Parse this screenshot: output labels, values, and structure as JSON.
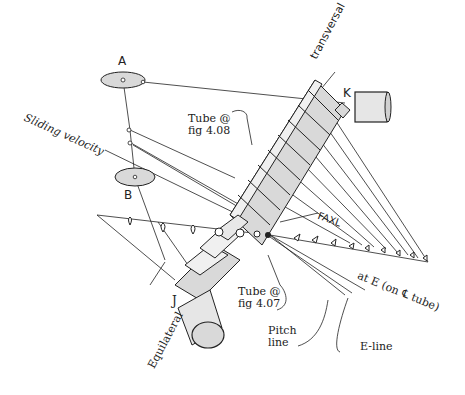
{
  "figure": {
    "colors": {
      "line": "#222222",
      "fill": "#d9d9d9",
      "background": "#ffffff"
    },
    "labels": {
      "A": "A",
      "B": "B",
      "K": "K",
      "J": "J",
      "transversal": "transversal",
      "sliding_velocity": "Sliding velocity",
      "tube_408_line1": "Tube @",
      "tube_408_line2": "fig 4.08",
      "tube_407_line1": "Tube @",
      "tube_407_line2": "fig 4.07",
      "faxl": "FAXL",
      "at_e": "at E (on ℄ tube)",
      "pitch_line1": "Pitch",
      "pitch_line2": "line",
      "e_line": "E-line",
      "equilateral": "Equilateral"
    }
  }
}
